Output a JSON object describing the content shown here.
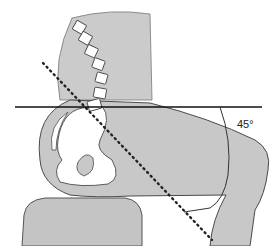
{
  "figure": {
    "type": "anatomical diagram",
    "angle_label": "45°",
    "elements": [
      "torso",
      "lumbar spine vertebrae",
      "pelvis",
      "thigh",
      "seat",
      "horizontal reference line",
      "dotted axis line",
      "angle arc"
    ]
  },
  "colors": {
    "body_fill": "#c8c8c8",
    "bone_fill": "#ffffff",
    "outline": "#4a4a4a",
    "line": "#111111"
  }
}
